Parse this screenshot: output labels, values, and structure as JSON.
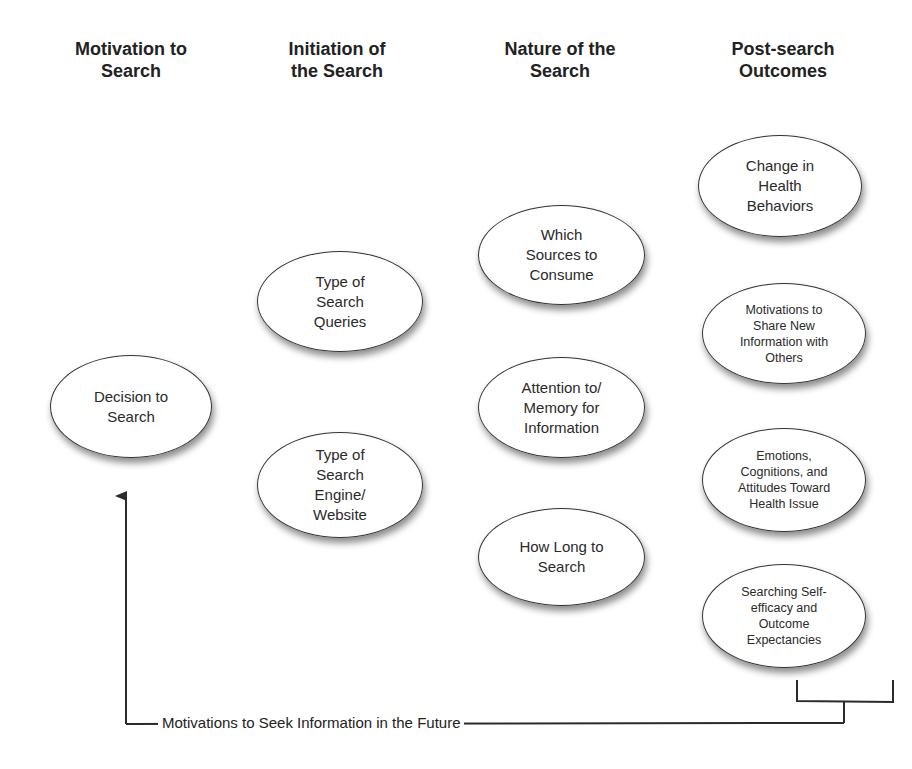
{
  "columns": [
    {
      "id": "motivation",
      "title": "Motivation to\nSearch"
    },
    {
      "id": "initiation",
      "title": "Initiation of\nthe Search"
    },
    {
      "id": "nature",
      "title": "Nature of the\nSearch"
    },
    {
      "id": "outcomes",
      "title": "Post-search\nOutcomes"
    }
  ],
  "nodes": {
    "decision": {
      "label": "Decision to\nSearch"
    },
    "query_type": {
      "label": "Type of\nSearch\nQueries"
    },
    "engine_type": {
      "label": "Type of\nSearch\nEngine/\nWebsite"
    },
    "sources": {
      "label": "Which\nSources to\nConsume"
    },
    "attention": {
      "label": "Attention to/\nMemory for\nInformation"
    },
    "duration": {
      "label": "How Long to\nSearch"
    },
    "behavior_change": {
      "label": "Change in\nHealth\nBehaviors"
    },
    "share": {
      "label": "Motivations to\nShare New\nInformation with\nOthers"
    },
    "emotions": {
      "label": "Emotions,\nCognitions, and\nAttitudes Toward\nHealth Issue"
    },
    "self_efficacy": {
      "label": "Searching Self-\nefficacy and\nOutcome\nExpectancies"
    }
  },
  "feedback": {
    "label": "Motivations to Seek Information in the Future",
    "from": "outcomes",
    "to": "decision"
  },
  "colors": {
    "line": "#2b2b2b",
    "node_fill": "#ffffff",
    "text": "#222222"
  }
}
